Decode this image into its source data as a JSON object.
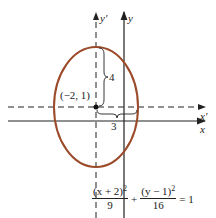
{
  "figure": {
    "axes": {
      "x_label": "x",
      "y_label": "y",
      "x_prime_label": "x'",
      "y_prime_label": "y'"
    },
    "center_label": "(−2, 1)",
    "semi_major_label": "4",
    "semi_minor_label": "3",
    "ellipse_color": "#9b4a2a",
    "equation": {
      "term1_num": "(x + 2)",
      "term1_exp": "2",
      "term1_den": "9",
      "plus": "+",
      "term2_num": "(y − 1)",
      "term2_exp": "2",
      "term2_den": "16",
      "rhs": "= 1"
    }
  }
}
